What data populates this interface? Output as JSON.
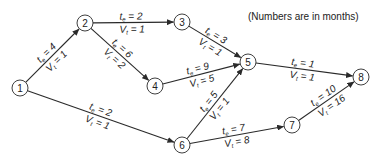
{
  "note": "(Numbers are in months)",
  "nodes": [
    {
      "id": "1",
      "label": "1",
      "x": 20,
      "y": 88
    },
    {
      "id": "2",
      "label": "2",
      "x": 85,
      "y": 23
    },
    {
      "id": "3",
      "label": "3",
      "x": 182,
      "y": 22
    },
    {
      "id": "4",
      "label": "4",
      "x": 155,
      "y": 86
    },
    {
      "id": "5",
      "label": "5",
      "x": 248,
      "y": 62
    },
    {
      "id": "6",
      "label": "6",
      "x": 182,
      "y": 145
    },
    {
      "id": "7",
      "label": "7",
      "x": 292,
      "y": 125
    },
    {
      "id": "8",
      "label": "8",
      "x": 361,
      "y": 77
    }
  ],
  "edges": [
    {
      "from": "1",
      "to": "2",
      "te": "4",
      "vt": "1"
    },
    {
      "from": "2",
      "to": "3",
      "te": "2",
      "vt": "1"
    },
    {
      "from": "2",
      "to": "4",
      "te": "6",
      "vt": "2"
    },
    {
      "from": "3",
      "to": "5",
      "te": "3",
      "vt": "1"
    },
    {
      "from": "4",
      "to": "5",
      "te": "9",
      "vt": "5"
    },
    {
      "from": "6",
      "to": "5",
      "te": "5",
      "vt": "1"
    },
    {
      "from": "5",
      "to": "8",
      "te": "1",
      "vt": "1"
    },
    {
      "from": "1",
      "to": "6",
      "te": "2",
      "vt": "1"
    },
    {
      "from": "6",
      "to": "7",
      "te": "7",
      "vt": "8"
    },
    {
      "from": "7",
      "to": "8",
      "te": "10",
      "vt": "16"
    }
  ],
  "label_prefix": {
    "te_main": "t",
    "te_sub": "e",
    "vt_main": "V",
    "vt_sub": "t",
    "equals": " = "
  }
}
